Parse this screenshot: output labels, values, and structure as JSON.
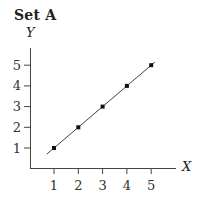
{
  "title": "Set A",
  "chart_data": {
    "type": "scatter",
    "title": "Set A",
    "xlabel": "X",
    "ylabel": "Y",
    "x": [
      1,
      2,
      3,
      4,
      5
    ],
    "y": [
      1,
      2,
      3,
      4,
      5
    ],
    "fit_line": {
      "slope": 1,
      "intercept": 0,
      "x_start": 0.7,
      "x_end": 5.15
    },
    "xticks": [
      "1",
      "2",
      "3",
      "4",
      "5"
    ],
    "yticks": [
      "1",
      "2",
      "3",
      "4",
      "5"
    ],
    "xlim": [
      0,
      6
    ],
    "ylim": [
      0,
      6
    ],
    "grid": false,
    "legend": null
  }
}
